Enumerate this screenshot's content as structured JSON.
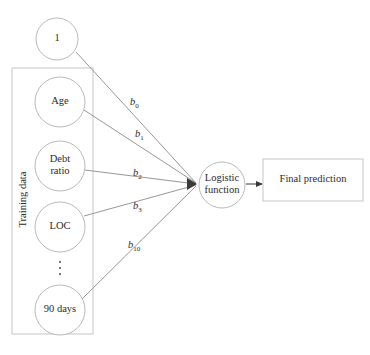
{
  "diagram": {
    "colors": {
      "stroke": "#b9b9b9",
      "edge": "#8a8a8a",
      "arrow": "#3a3a3a",
      "text": "#2b2b2b",
      "background": "#ffffff"
    },
    "group_box": {
      "label": "Training data",
      "x": 12,
      "y": 68,
      "width": 81,
      "height": 266
    },
    "input_nodes": [
      {
        "id": "bias",
        "label": "1",
        "cx": 57,
        "cy": 39,
        "r": 21,
        "in_group": false
      },
      {
        "id": "age",
        "label": "Age",
        "cx": 60,
        "cy": 102,
        "r": 25,
        "in_group": true
      },
      {
        "id": "debt-ratio",
        "label": "Debt\nratio",
        "cx": 60,
        "cy": 166,
        "r": 25,
        "in_group": true
      },
      {
        "id": "loc",
        "label": "LOC",
        "cx": 60,
        "cy": 227,
        "r": 25,
        "in_group": true
      },
      {
        "id": "ninety-days",
        "label": "90 days",
        "cx": 60,
        "cy": 310,
        "r": 25,
        "in_group": true
      }
    ],
    "ellipsis": {
      "cx": 60,
      "cy": 268,
      "dots": 3
    },
    "edges": [
      {
        "from": "bias",
        "label": "b",
        "subscript": "0",
        "label_x": 130,
        "label_y": 96,
        "start_x": 76,
        "start_y": 52,
        "end_x": 196,
        "end_y": 183
      },
      {
        "from": "age",
        "label": "b",
        "subscript": "1",
        "label_x": 135,
        "label_y": 128,
        "start_x": 84,
        "start_y": 110,
        "end_x": 196,
        "end_y": 183
      },
      {
        "from": "debt-ratio",
        "label": "b",
        "subscript": "2",
        "label_x": 133,
        "label_y": 167,
        "start_x": 85,
        "start_y": 170,
        "end_x": 196,
        "end_y": 184
      },
      {
        "from": "loc",
        "label": "b",
        "subscript": "3",
        "label_x": 133,
        "label_y": 200,
        "start_x": 84,
        "start_y": 216,
        "end_x": 196,
        "end_y": 185
      },
      {
        "from": "ninety-days",
        "label": "b",
        "subscript": "10",
        "label_x": 128,
        "label_y": 239,
        "start_x": 82,
        "start_y": 299,
        "end_x": 196,
        "end_y": 186
      }
    ],
    "logistic_node": {
      "label": "Logistic\nfunction",
      "cx": 222,
      "cy": 185,
      "r": 23
    },
    "output_box": {
      "label": "Final prediction",
      "x": 263,
      "y": 159,
      "width": 100,
      "height": 42
    },
    "output_arrow": {
      "start_x": 246,
      "start_y": 184,
      "end_x": 262,
      "end_y": 184
    }
  }
}
